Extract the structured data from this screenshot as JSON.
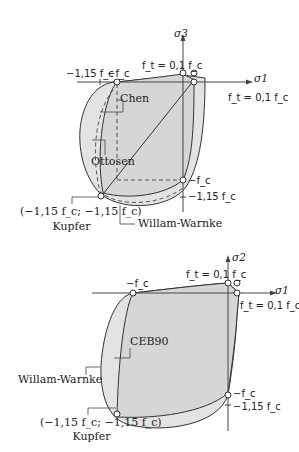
{
  "colors": {
    "fill": "#d9d9d9",
    "fill_light": "#e6e6e6",
    "stroke": "#333333",
    "axis": "#444444",
    "background": "#ffffff"
  },
  "top_diagram": {
    "axis_x_label": "σ1",
    "axis_y_label": "σ3",
    "tension_label_top": "f_t = 0,1 f_c",
    "tension_label_right": "f_t = 0,1 f_c",
    "neg_fc_top": "−f_c",
    "neg_115fc_top": "−1,15 f_c",
    "neg_fc_right": "−f_c",
    "neg_115fc_right": "−1,15 f_c",
    "callouts": {
      "chen": "Chen",
      "ottosen": "Ottosen",
      "willam_warnke": "Willam-Warnke",
      "kupfer_coords": "(−1,15 f_c; −1,15 f_c)",
      "kupfer": "Kupfer"
    }
  },
  "bottom_diagram": {
    "axis_x_label": "σ1",
    "axis_y_label": "σ2",
    "tension_label_top": "f_t = 0,1 f_c",
    "tension_label_right": "f_t = 0,1 f_c",
    "neg_fc_top": "−f_c",
    "neg_fc_right": "−f_c",
    "neg_115fc_right": "−1,15 f_c",
    "callouts": {
      "ceb90": "CEB90",
      "willam_warnke": "Willam-Warnke",
      "kupfer_coords": "(−1,15 f_c; −1,15 f_c)",
      "kupfer": "Kupfer"
    }
  }
}
